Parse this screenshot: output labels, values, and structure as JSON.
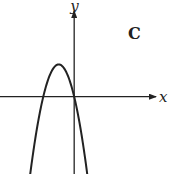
{
  "chart_data": {
    "type": "line",
    "title": "",
    "panel_label": "C",
    "xlabel": "x",
    "ylabel": "y",
    "grid": false,
    "ticks": "none",
    "xlim": [
      -4.8,
      6.2
    ],
    "ylim": [
      -2.4,
      3.0
    ],
    "series": [
      {
        "name": "parabola",
        "equation": "y = -x^2 - 2x",
        "vertex": [
          -1,
          1
        ],
        "roots": [
          -2,
          0
        ],
        "x_range": [
          -2.85,
          0.85
        ]
      }
    ],
    "color": "#222222"
  }
}
